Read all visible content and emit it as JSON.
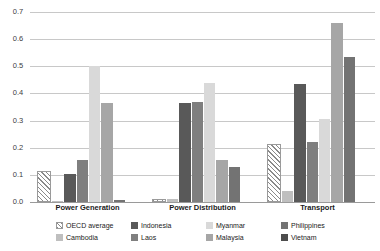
{
  "chart_data": {
    "type": "bar",
    "title": "",
    "subtitle": "",
    "xlabel": "",
    "ylabel": "",
    "ylim": [
      0.0,
      0.7
    ],
    "ytick_labels": [
      "0.0",
      "0.1",
      "0.2",
      "0.3",
      "0.4",
      "0.5",
      "0.6",
      "0.7"
    ],
    "ytick_values": [
      0.0,
      0.1,
      0.2,
      0.3,
      0.4,
      0.5,
      0.6,
      0.7
    ],
    "grid": true,
    "legend_position": "bottom",
    "categories": [
      "Power Generation",
      "Power Distribution",
      "Transport"
    ],
    "series": [
      {
        "name": "OECD average",
        "pattern": "diagonal-hatch",
        "color": "#ffffff",
        "values": [
          0.115,
          0.01,
          0.215
        ]
      },
      {
        "name": "Cambodia",
        "color": "#bfbfbf",
        "values": [
          0.005,
          0.012,
          0.04
        ]
      },
      {
        "name": "Indonesia",
        "color": "#595959",
        "values": [
          0.105,
          0.365,
          0.435
        ]
      },
      {
        "name": "Laos",
        "color": "#7f7f7f",
        "values": [
          0.155,
          0.37,
          0.22
        ]
      },
      {
        "name": "Myanmar",
        "color": "#d9d9d9",
        "values": [
          0.5,
          0.44,
          0.305
        ]
      },
      {
        "name": "Malaysia",
        "color": "#a6a6a6",
        "values": [
          0.365,
          0.155,
          0.66
        ]
      },
      {
        "name": "Philippines",
        "color": "#737373",
        "values": [
          0.008,
          0.13,
          0.535
        ]
      },
      {
        "name": "Vietnam",
        "color": "#4d4d4d",
        "values": [
          0.0,
          0.0,
          0.0
        ]
      }
    ]
  },
  "legend": {
    "items": [
      {
        "label": "OECD average"
      },
      {
        "label": "Indonesia"
      },
      {
        "label": "Myanmar"
      },
      {
        "label": "Philippines"
      },
      {
        "label": "Cambodia"
      },
      {
        "label": "Laos"
      },
      {
        "label": "Malaysia"
      },
      {
        "label": "Vietnam"
      }
    ]
  },
  "colors": {
    "gridline": "#c8c8c8",
    "baseline": "#9a9a9a",
    "text": "#1a1a1a",
    "tick_text": "#404040",
    "background": "#ffffff"
  }
}
